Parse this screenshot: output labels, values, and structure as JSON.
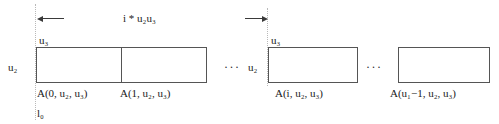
{
  "figure": {
    "stride_label": "i * u₂u₃",
    "base_pointer_label": "l₀",
    "row_extent_label": "u₂",
    "col_extent_label": "u₃",
    "ellipsis": "···",
    "arrow_left_name": "left-arrow",
    "arrow_right_name": "right-arrow",
    "line_color": "#555555",
    "guide_color": "#b9b9b9",
    "text_color": "#1a1a1a",
    "background_color": "#ffffff"
  },
  "left_group": {
    "row_label": "u₂",
    "col_label": "u₃",
    "cells": [
      {
        "caption": "A(0, u₂, u₃)"
      },
      {
        "caption": "A(1, u₂, u₃)"
      }
    ]
  },
  "right_group": {
    "row_label": "u₂",
    "col_label": "u₃",
    "cells": [
      {
        "caption": "A(i, u₂, u₃)"
      },
      {
        "caption": "A(u₁−1, u₂, u₃)"
      }
    ]
  }
}
